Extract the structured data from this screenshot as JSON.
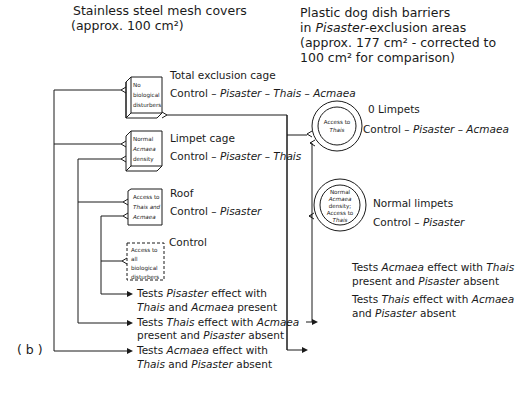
{
  "headers": {
    "left": {
      "line1": "Stainless steel mesh covers",
      "line2": "(approx. 100 cm²)"
    },
    "right": {
      "line1": "Plastic dog dish barriers",
      "line2_pre": "in ",
      "line2_it": "Pisaster",
      "line2_post": "-exclusion areas",
      "line3": "(approx. 177 cm² - corrected to",
      "line4": "100 cm² for comparison)"
    }
  },
  "panel_label": "( b )",
  "treatments": [
    {
      "title": "Total exclusion cage",
      "control_prefix": "Control – ",
      "control_species": "Pisaster – Thais – Acmaea",
      "box_lines": [
        "No",
        "biological",
        "disturbers"
      ],
      "box_style": "solid-3d"
    },
    {
      "title": "Limpet cage",
      "control_prefix": "Control – ",
      "control_species": "Pisaster – Thais",
      "box_lines": [
        "Normal",
        "Acmaea",
        "density"
      ],
      "box_style": "solid-3d"
    },
    {
      "title": "Roof",
      "control_prefix": "Control – ",
      "control_species": "Pisaster",
      "box_lines": [
        "Access to",
        "Thais and",
        "Acmaea"
      ],
      "box_style": "solid-flat"
    },
    {
      "title": "Control",
      "box_lines": [
        "Access to",
        "all",
        "biological",
        "disturbers"
      ],
      "box_style": "dashed"
    },
    {
      "title": "0 Limpets",
      "control_prefix": "Control – ",
      "control_species": "Pisaster – Acmaea",
      "circle_lines": [
        "Access to",
        "Thais"
      ],
      "shape": "circle"
    },
    {
      "title": "Normal limpets",
      "control_prefix": "Control – ",
      "control_species": "Pisaster",
      "circle_lines": [
        "Normal",
        "Acmaea",
        "density;",
        "Access to",
        "Thais"
      ],
      "shape": "circle"
    }
  ],
  "tests": [
    {
      "l1": [
        "Tests ",
        "Pisaster",
        " effect with"
      ],
      "l2": [
        "",
        "Thais",
        " and ",
        "Acmaea",
        " present"
      ]
    },
    {
      "l1": [
        "Tests ",
        "Thais",
        " effect with ",
        "Acmaea"
      ],
      "l2": [
        "present and ",
        "Pisaster",
        " absent"
      ]
    },
    {
      "l1": [
        "Tests ",
        "Acmaea",
        " effect with"
      ],
      "l2": [
        "",
        "Thais",
        " and ",
        "Pisaster",
        " absent"
      ]
    },
    {
      "l1": [
        "Tests ",
        "Acmaea",
        " effect with ",
        "Thais"
      ],
      "l2": [
        "present and ",
        "Pisaster",
        " absent"
      ]
    },
    {
      "l1": [
        "Tests ",
        "Thais",
        " effect with ",
        "Acmaea"
      ],
      "l2": [
        "and ",
        "Pisaster",
        " absent"
      ]
    }
  ]
}
